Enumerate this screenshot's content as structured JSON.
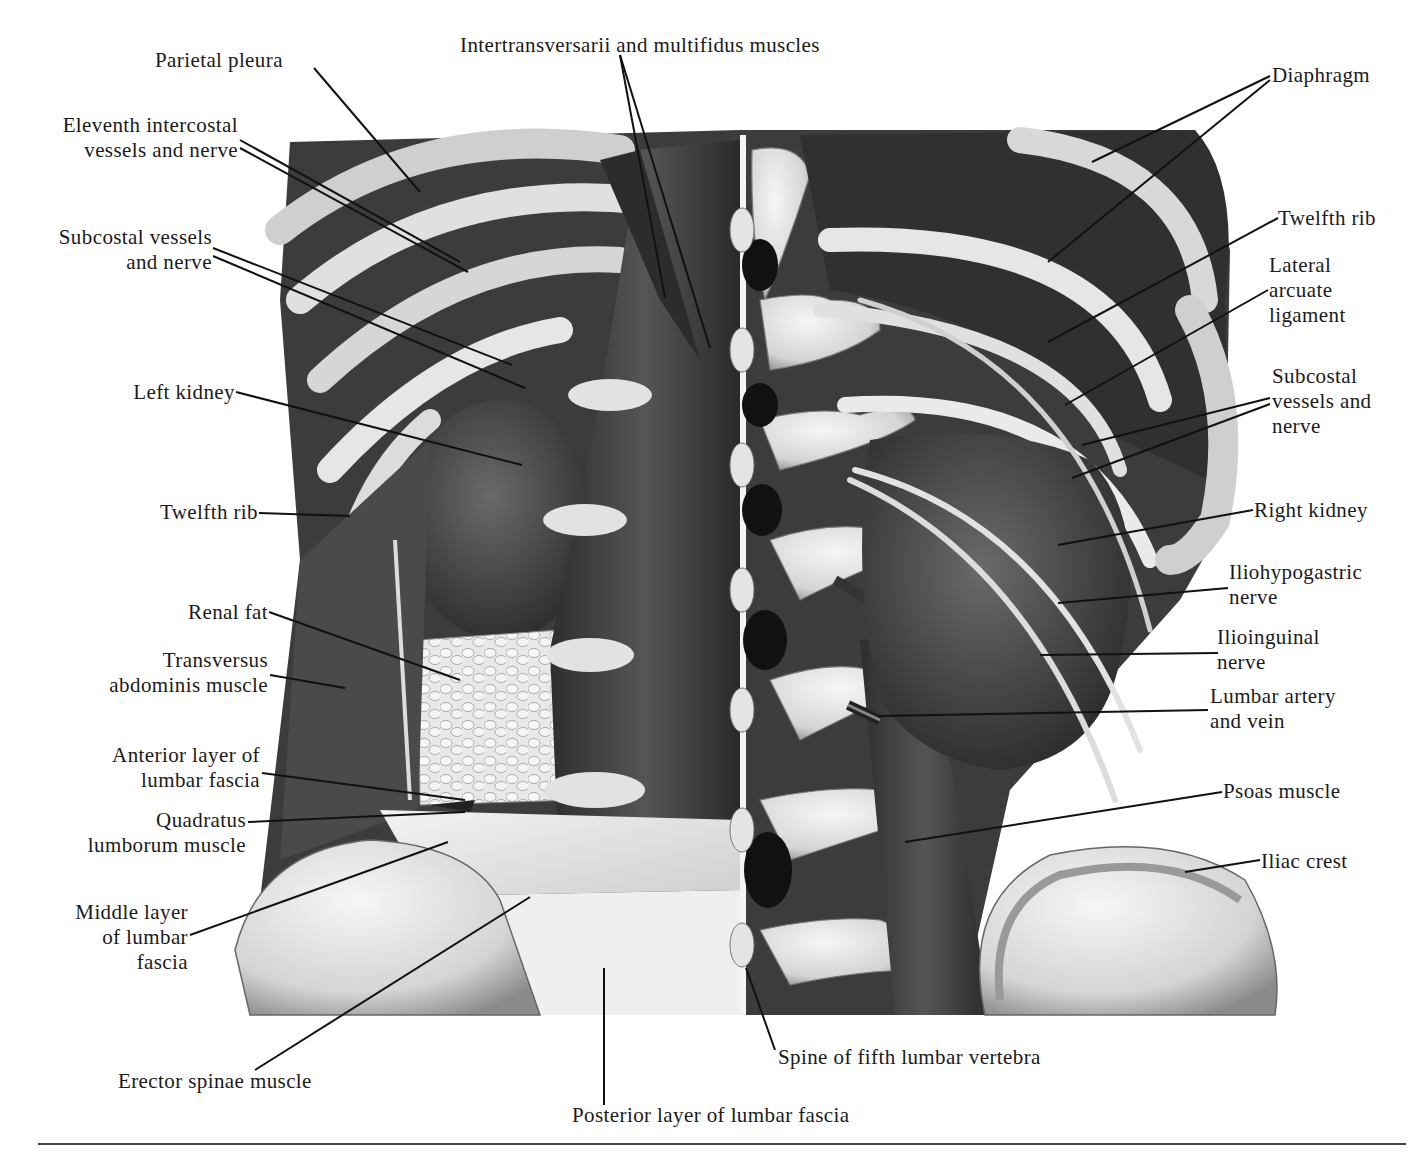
{
  "figure": {
    "palette": {
      "muscle_dark": "#3a3a3a",
      "muscle_mid": "#5a5a5a",
      "bone_light": "#e6e6e6",
      "bone_shadow": "#9a9a9a",
      "kidney": "#4a4a4a",
      "fat": "#d8d8d8",
      "fascia": "#eeeeee",
      "ink": "#1a1a1a"
    }
  },
  "labels": [
    {
      "id": "parietal-pleura",
      "text": "Parietal pleura",
      "x": 155,
      "y": 48,
      "align": "l",
      "line": [
        [
          314,
          68
        ],
        [
          420,
          192
        ]
      ]
    },
    {
      "id": "intertransversarii",
      "text": "Intertransversarii and multifidus muscles",
      "x": 460,
      "y": 33,
      "align": "l",
      "line": [
        [
          620,
          55
        ],
        [
          665,
          298
        ],
        [
          620,
          55
        ],
        [
          710,
          348
        ]
      ]
    },
    {
      "id": "eleventh-intercostal",
      "text": "Eleventh intercostal\nvessels and nerve",
      "x": 238,
      "y": 113,
      "align": "r",
      "line": [
        [
          240,
          140
        ],
        [
          460,
          262
        ],
        [
          240,
          148
        ],
        [
          468,
          272
        ]
      ]
    },
    {
      "id": "subcostal-left",
      "text": "Subcostal vessels\nand nerve",
      "x": 212,
      "y": 225,
      "align": "r",
      "line": [
        [
          213,
          248
        ],
        [
          512,
          365
        ],
        [
          213,
          256
        ],
        [
          525,
          388
        ]
      ]
    },
    {
      "id": "left-kidney",
      "text": "Left kidney",
      "x": 235,
      "y": 380,
      "align": "r",
      "line": [
        [
          236,
          392
        ],
        [
          522,
          465
        ]
      ]
    },
    {
      "id": "twelfth-rib-left",
      "text": "Twelfth rib",
      "x": 258,
      "y": 500,
      "align": "r",
      "line": [
        [
          259,
          513
        ],
        [
          350,
          516
        ]
      ]
    },
    {
      "id": "renal-fat",
      "text": "Renal fat",
      "x": 268,
      "y": 600,
      "align": "r",
      "line": [
        [
          269,
          612
        ],
        [
          460,
          680
        ]
      ]
    },
    {
      "id": "transversus-abdominis",
      "text": "Transversus\nabdominis muscle",
      "x": 268,
      "y": 648,
      "align": "r",
      "line": [
        [
          270,
          675
        ],
        [
          345,
          688
        ]
      ]
    },
    {
      "id": "anterior-lumbar-fascia",
      "text": "Anterior layer of\nlumbar fascia",
      "x": 260,
      "y": 743,
      "align": "r",
      "line": [
        [
          262,
          773
        ],
        [
          465,
          800
        ]
      ]
    },
    {
      "id": "quadratus-lumborum",
      "text": "Quadratus\nlumborum muscle",
      "x": 246,
      "y": 808,
      "align": "r",
      "line": [
        [
          248,
          822
        ],
        [
          465,
          812
        ]
      ]
    },
    {
      "id": "middle-lumbar-fascia",
      "text": "Middle layer\nof lumbar\nfascia",
      "x": 188,
      "y": 900,
      "align": "r",
      "line": [
        [
          190,
          935
        ],
        [
          448,
          842
        ]
      ]
    },
    {
      "id": "erector-spinae",
      "text": "Erector spinae muscle",
      "x": 118,
      "y": 1069,
      "align": "l",
      "line": [
        [
          255,
          1070
        ],
        [
          530,
          897
        ]
      ]
    },
    {
      "id": "posterior-lumbar-fascia",
      "text": "Posterior layer of lumbar fascia",
      "x": 572,
      "y": 1103,
      "align": "l",
      "line": [
        [
          604,
          1105
        ],
        [
          604,
          968
        ]
      ]
    },
    {
      "id": "spine-fifth-lumbar",
      "text": "Spine of fifth lumbar vertebra",
      "x": 778,
      "y": 1045,
      "align": "l",
      "line": [
        [
          775,
          1050
        ],
        [
          746,
          968
        ]
      ]
    },
    {
      "id": "diaphragm",
      "text": "Diaphragm",
      "x": 1272,
      "y": 63,
      "align": "l",
      "line": [
        [
          1270,
          76
        ],
        [
          1092,
          162
        ],
        [
          1270,
          80
        ],
        [
          1048,
          262
        ]
      ]
    },
    {
      "id": "twelfth-rib-right",
      "text": "Twelfth rib",
      "x": 1278,
      "y": 206,
      "align": "l",
      "line": [
        [
          1278,
          218
        ],
        [
          1048,
          342
        ]
      ]
    },
    {
      "id": "lateral-arcuate-ligament",
      "text": "Lateral\narcuate\nligament",
      "x": 1269,
      "y": 253,
      "align": "l",
      "line": [
        [
          1268,
          290
        ],
        [
          1065,
          405
        ]
      ]
    },
    {
      "id": "subcostal-right",
      "text": "Subcostal\nvessels and\nnerve",
      "x": 1272,
      "y": 364,
      "align": "l",
      "line": [
        [
          1270,
          398
        ],
        [
          1082,
          445
        ],
        [
          1270,
          404
        ],
        [
          1072,
          478
        ]
      ]
    },
    {
      "id": "right-kidney",
      "text": "Right kidney",
      "x": 1254,
      "y": 498,
      "align": "l",
      "line": [
        [
          1253,
          510
        ],
        [
          1058,
          545
        ]
      ]
    },
    {
      "id": "iliohypogastric-nerve",
      "text": "Iliohypogastric\nnerve",
      "x": 1229,
      "y": 560,
      "align": "l",
      "line": [
        [
          1228,
          588
        ],
        [
          1058,
          603
        ]
      ]
    },
    {
      "id": "ilioinguinal-nerve",
      "text": "Ilioinguinal\nnerve",
      "x": 1217,
      "y": 625,
      "align": "l",
      "line": [
        [
          1218,
          653
        ],
        [
          1040,
          655
        ]
      ]
    },
    {
      "id": "lumbar-artery-vein",
      "text": "Lumbar artery\nand vein",
      "x": 1210,
      "y": 684,
      "align": "l",
      "line": [
        [
          1208,
          710
        ],
        [
          878,
          716
        ]
      ]
    },
    {
      "id": "psoas-muscle",
      "text": "Psoas muscle",
      "x": 1223,
      "y": 779,
      "align": "l",
      "line": [
        [
          1222,
          792
        ],
        [
          905,
          842
        ]
      ]
    },
    {
      "id": "iliac-crest",
      "text": "Iliac crest",
      "x": 1261,
      "y": 849,
      "align": "l",
      "line": [
        [
          1260,
          860
        ],
        [
          1185,
          872
        ]
      ]
    }
  ]
}
